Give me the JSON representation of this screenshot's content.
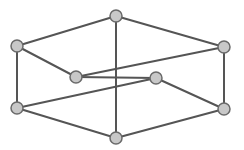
{
  "graph": {
    "colors": {
      "background": "#ffffff",
      "edge": "#555555",
      "node_fill": "#c8c8c8",
      "node_stroke": "#6a6a6a"
    },
    "node_radius": 6,
    "nodes": [
      {
        "id": "top",
        "x": 116,
        "y": 16
      },
      {
        "id": "left-upper",
        "x": 17,
        "y": 46
      },
      {
        "id": "right-upper",
        "x": 224,
        "y": 47
      },
      {
        "id": "inner-left",
        "x": 76,
        "y": 77
      },
      {
        "id": "inner-right",
        "x": 156,
        "y": 78
      },
      {
        "id": "left-lower",
        "x": 17,
        "y": 108
      },
      {
        "id": "right-lower",
        "x": 224,
        "y": 109
      },
      {
        "id": "bottom",
        "x": 116,
        "y": 138
      }
    ],
    "edges": [
      [
        "top",
        "left-upper"
      ],
      [
        "top",
        "right-upper"
      ],
      [
        "top",
        "bottom"
      ],
      [
        "left-upper",
        "left-lower"
      ],
      [
        "left-upper",
        "inner-left"
      ],
      [
        "right-upper",
        "right-lower"
      ],
      [
        "right-upper",
        "inner-left"
      ],
      [
        "inner-left",
        "inner-right"
      ],
      [
        "inner-right",
        "left-lower"
      ],
      [
        "inner-right",
        "right-lower"
      ],
      [
        "left-lower",
        "bottom"
      ],
      [
        "right-lower",
        "bottom"
      ]
    ]
  }
}
